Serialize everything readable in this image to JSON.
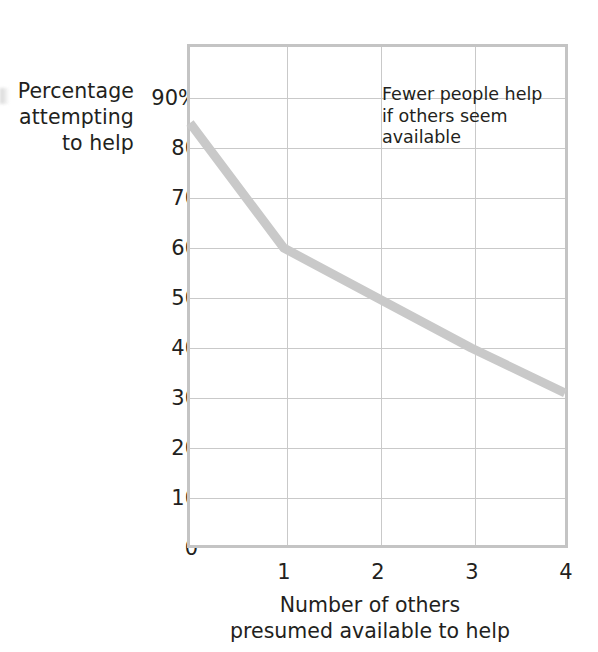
{
  "chart_data": {
    "type": "line",
    "title": "",
    "subtitle": "",
    "xlabel": "Number of others presumed available to help",
    "xlabel_lines": [
      "Number of others",
      "presumed available to help"
    ],
    "ylabel": "Percentage attempting to help",
    "ylabel_lines": [
      "Percentage",
      "attempting",
      "to help"
    ],
    "x": [
      0,
      1,
      2,
      3,
      4
    ],
    "values": [
      85,
      60,
      50,
      40,
      31
    ],
    "series": [
      {
        "name": "Percentage attempting to help",
        "values": [
          85,
          60,
          50,
          40,
          31
        ]
      }
    ],
    "xlim": [
      0,
      4
    ],
    "ylim": [
      0,
      90
    ],
    "xticks": [
      1,
      2,
      3,
      4
    ],
    "xticklabels": [
      "1",
      "2",
      "3",
      "4"
    ],
    "yticks": [
      0,
      10,
      20,
      30,
      40,
      50,
      60,
      70,
      80,
      90
    ],
    "yticklabels": [
      "0",
      "10",
      "20",
      "30",
      "40",
      "50",
      "60",
      "70",
      "80",
      "90%"
    ],
    "grid": true,
    "grid_axes": "both",
    "legend": false,
    "legend_position": "none",
    "annotations": [
      {
        "text": "Fewer people help if others seem available",
        "lines": [
          "Fewer people help",
          "if others seem",
          "available"
        ],
        "x": 2.05,
        "y": 82
      }
    ],
    "colors": {
      "line": "#c9c9c9",
      "grid": "#c9c9c9",
      "frame": "#c4c4c4",
      "text": "#231f20",
      "background": "#ffffff"
    },
    "line_width_px": 9
  },
  "yticklabels": {
    "t0": "0",
    "t10": "10",
    "t20": "20",
    "t30": "30",
    "t40": "40",
    "t50": "50",
    "t60": "60",
    "t70": "70",
    "t80": "80",
    "t90": "90%"
  },
  "xticklabels": {
    "t1": "1",
    "t2": "2",
    "t3": "3",
    "t4": "4"
  },
  "ylabel": {
    "line1": "Percentage",
    "line2": "attempting",
    "line3": "to help"
  },
  "xlabel": {
    "line1": "Number of others",
    "line2": "presumed available to help"
  },
  "annotation": {
    "line1": "Fewer people help",
    "line2": "if others seem",
    "line3": "available"
  }
}
